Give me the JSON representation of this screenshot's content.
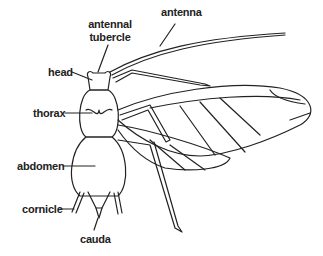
{
  "diagram": {
    "labels": {
      "antenna": "antenna",
      "antennal_tubercle_1": "antennal",
      "antennal_tubercle_2": "tubercle",
      "head": "head",
      "thorax": "thorax",
      "abdomen": "abdomen",
      "cornicle": "cornicle",
      "cauda": "cauda"
    },
    "colors": {
      "ink": "#222222",
      "background": "#ffffff"
    }
  }
}
